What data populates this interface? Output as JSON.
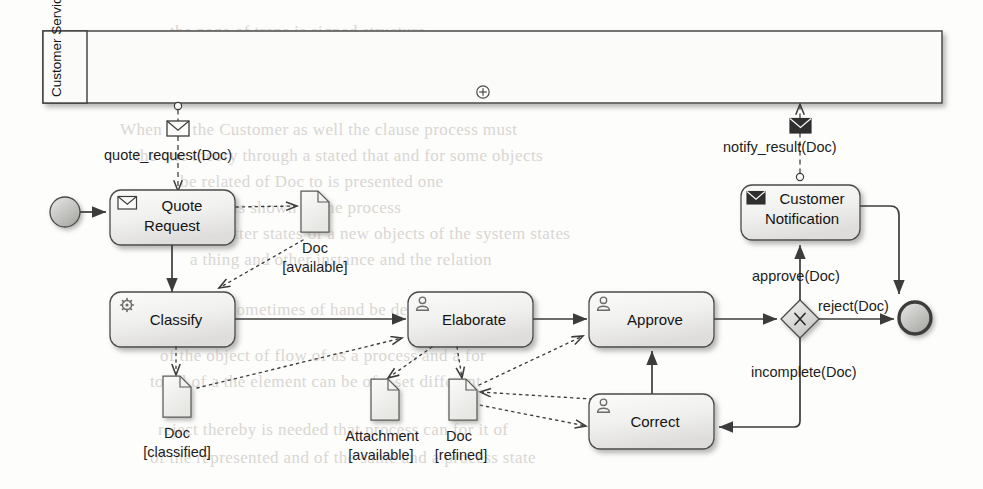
{
  "diagram": {
    "type": "bpmn-collaboration-diagram"
  },
  "pool": {
    "name": "Customer Service",
    "collapsed_marker": "plus-icon",
    "collapsed": true
  },
  "events": [
    {
      "id": "start",
      "kind": "start-event",
      "label": ""
    },
    {
      "id": "end",
      "kind": "end-event",
      "label": ""
    }
  ],
  "tasks": [
    {
      "id": "quote_request",
      "label_line1": "Quote",
      "label_line2": "Request",
      "icon": "message-receive-icon",
      "type": "receive-task"
    },
    {
      "id": "classify",
      "label_line1": "Classify",
      "label_line2": "",
      "icon": "gear-icon",
      "type": "service-task"
    },
    {
      "id": "elaborate",
      "label_line1": "Elaborate",
      "label_line2": "",
      "icon": "user-icon",
      "type": "user-task"
    },
    {
      "id": "approve",
      "label_line1": "Approve",
      "label_line2": "",
      "icon": "user-icon",
      "type": "user-task"
    },
    {
      "id": "correct",
      "label_line1": "Correct",
      "label_line2": "",
      "icon": "user-icon",
      "type": "user-task"
    },
    {
      "id": "customer_notification",
      "label_line1": "Customer",
      "label_line2": "Notification",
      "icon": "message-send-icon",
      "type": "send-task"
    }
  ],
  "gateway": {
    "id": "xor_gateway",
    "type": "exclusive-gateway",
    "marker": "x-marker"
  },
  "data_objects": [
    {
      "id": "doc_available",
      "name": "Doc",
      "state": "[available]"
    },
    {
      "id": "doc_classified",
      "name": "Doc",
      "state": "[classified]"
    },
    {
      "id": "attachment_available",
      "name": "Attachment",
      "state": "[available]"
    },
    {
      "id": "doc_refined",
      "name": "Doc",
      "state": "[refined]"
    }
  ],
  "message_flows": [
    {
      "id": "quote_request_msg",
      "label": "quote_request(Doc)",
      "envelope": "message-envelope-white-icon",
      "direction": "pool-to-process"
    },
    {
      "id": "notify_result_msg",
      "label": "notify_result(Doc)",
      "envelope": "message-envelope-dark-icon",
      "direction": "process-to-pool"
    }
  ],
  "sequence_flow_labels": [
    {
      "id": "approve_flow",
      "label": "approve(Doc)"
    },
    {
      "id": "reject_flow",
      "label": "reject(Doc)"
    },
    {
      "id": "incomplete_flow",
      "label": "incomplete(Doc)"
    }
  ],
  "colors": {
    "stroke": "#3c3c3c",
    "shape_fill_light": "#f4f4f2",
    "shape_fill_mid": "#e3e3e0",
    "event_fill": "#c9c9c6",
    "text": "#1d1d1d"
  },
  "background_text": [
    "the ghost of reversed page text is faintly visible",
    "behind the diagram in the scanned original"
  ]
}
